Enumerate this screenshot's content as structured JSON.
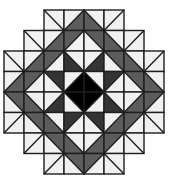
{
  "figure": {
    "grid": {
      "cols": 8,
      "rows": 8,
      "cell_w": 20,
      "cell_h": 20.5,
      "origin_x": 4,
      "origin_y": 10
    },
    "colors": {
      "L": "#f1f1f1",
      "G": "#5c5c5c",
      "D": "#343434",
      "K": "#000000",
      "line": "#1e1e1e"
    },
    "legend_note": "cell = [diagonal, fill1, fill2]; for '/' fill1=upper-left, fill2=lower-right; for '\\' fill1=upper-right, fill2=lower-left",
    "rows": [
      [
        null,
        null,
        [
          "\\",
          "L",
          "L"
        ],
        [
          "/",
          "L",
          "G"
        ],
        [
          "\\",
          "L",
          "G"
        ],
        [
          "/",
          "L",
          "L"
        ],
        null,
        null
      ],
      [
        null,
        [
          "\\",
          "L",
          "L"
        ],
        [
          "/",
          "L",
          "G"
        ],
        [
          "/",
          "G",
          "L"
        ],
        [
          "\\",
          "G",
          "L"
        ],
        [
          "\\",
          "L",
          "G"
        ],
        [
          "/",
          "L",
          "L"
        ],
        null
      ],
      [
        [
          "\\",
          "L",
          "L"
        ],
        [
          "/",
          "L",
          "G"
        ],
        [
          "/",
          "G",
          "L"
        ],
        [
          "\\",
          "L",
          "D"
        ],
        [
          "/",
          "L",
          "D"
        ],
        [
          "\\",
          "G",
          "L"
        ],
        [
          "\\",
          "L",
          "G"
        ],
        [
          "/",
          "L",
          "L"
        ]
      ],
      [
        [
          "/",
          "L",
          "G"
        ],
        [
          "/",
          "G",
          "L"
        ],
        [
          "\\",
          "D",
          "L"
        ],
        [
          "/",
          "L",
          "K"
        ],
        [
          "\\",
          "L",
          "K"
        ],
        [
          "/",
          "D",
          "L"
        ],
        [
          "\\",
          "G",
          "L"
        ],
        [
          "\\",
          "L",
          "G"
        ]
      ],
      [
        [
          "\\",
          "G",
          "L"
        ],
        [
          "\\",
          "L",
          "G"
        ],
        [
          "/",
          "L",
          "D"
        ],
        [
          "\\",
          "K",
          "L"
        ],
        [
          "/",
          "K",
          "L"
        ],
        [
          "\\",
          "L",
          "D"
        ],
        [
          "/",
          "L",
          "G"
        ],
        [
          "/",
          "G",
          "L"
        ]
      ],
      [
        [
          "/",
          "L",
          "L"
        ],
        [
          "\\",
          "G",
          "L"
        ],
        [
          "\\",
          "L",
          "G"
        ],
        [
          "/",
          "D",
          "L"
        ],
        [
          "\\",
          "D",
          "L"
        ],
        [
          "/",
          "L",
          "G"
        ],
        [
          "/",
          "G",
          "L"
        ],
        [
          "\\",
          "L",
          "L"
        ]
      ],
      [
        null,
        [
          "/",
          "L",
          "L"
        ],
        [
          "\\",
          "G",
          "L"
        ],
        [
          "\\",
          "L",
          "G"
        ],
        [
          "/",
          "L",
          "G"
        ],
        [
          "/",
          "G",
          "L"
        ],
        [
          "\\",
          "L",
          "L"
        ],
        null
      ],
      [
        null,
        null,
        [
          "/",
          "L",
          "L"
        ],
        [
          "\\",
          "G",
          "L"
        ],
        [
          "/",
          "G",
          "L"
        ],
        [
          "\\",
          "L",
          "L"
        ],
        null,
        null
      ]
    ]
  }
}
